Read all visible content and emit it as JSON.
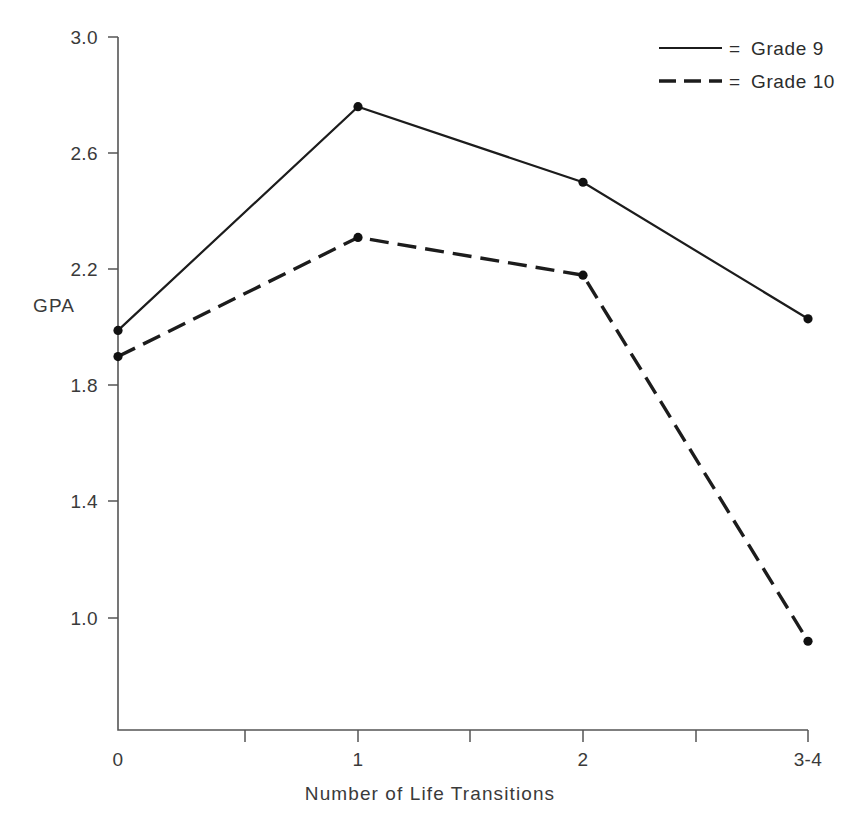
{
  "chart_data": {
    "type": "line",
    "title": "",
    "xlabel": "Number of Life Transitions",
    "ylabel": "GPA",
    "categories": [
      "0",
      "1",
      "2",
      "3-4"
    ],
    "xtick_labels": [
      "0",
      "1",
      "2",
      "3-4"
    ],
    "ytick_labels": [
      "3.0",
      "2.6",
      "2.2",
      "1.8",
      "1.4",
      "1.0"
    ],
    "yticks": [
      3.0,
      2.6,
      2.2,
      1.8,
      1.4,
      1.0
    ],
    "ylim": [
      0.83,
      3.0
    ],
    "grid": false,
    "legend_position": "top-right",
    "minor_xticks": true,
    "series": [
      {
        "name": "Grade 9",
        "style": "solid",
        "marker": "filled-circle",
        "color": "#1c1c1c",
        "values": [
          1.99,
          2.76,
          2.5,
          2.03
        ]
      },
      {
        "name": "Grade 10",
        "style": "dashed",
        "marker": "filled-circle",
        "color": "#1c1c1c",
        "values": [
          1.9,
          2.31,
          2.18,
          0.92
        ]
      }
    ]
  },
  "legend": {
    "equals_symbol": "=",
    "entries": [
      {
        "label": "Grade 9",
        "style": "solid"
      },
      {
        "label": "Grade 10",
        "style": "dashed"
      }
    ]
  },
  "axes": {
    "y_axis_title": "GPA",
    "x_axis_title": "Number of Life Transitions",
    "y_tick_labels": [
      "3.0",
      "2.6",
      "2.2",
      "1.8",
      "1.4",
      "1.0"
    ],
    "x_tick_labels": [
      "0",
      "1",
      "2",
      "3-4"
    ]
  },
  "colors": {
    "background": "#ffffff",
    "line": "#1c1c1c",
    "axis": "#555555",
    "text": "#3a3a3a"
  }
}
